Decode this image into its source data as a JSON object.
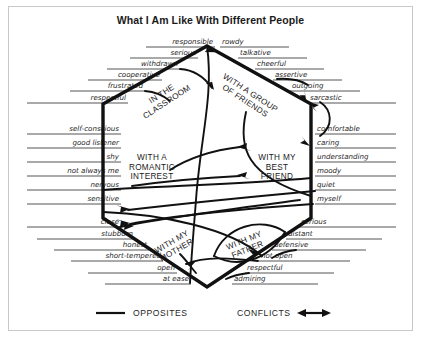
{
  "title": "What I Am Like With Different People",
  "diagram_type": "hexagonal venn-style social-context map",
  "regions": [
    {
      "id": "classroom",
      "label_lines": [
        "IN THE",
        "CLASSROOM"
      ],
      "x": 163,
      "y": 96,
      "rotate": -33
    },
    {
      "id": "friends",
      "label_lines": [
        "WITH A GROUP",
        "OF FRIENDS"
      ],
      "x": 249,
      "y": 95,
      "rotate": 33
    },
    {
      "id": "romantic",
      "label_lines": [
        "WITH A",
        "ROMANTIC",
        "INTEREST"
      ],
      "x": 152,
      "y": 160,
      "rotate": 0
    },
    {
      "id": "bestfriend",
      "label_lines": [
        "WITH MY",
        "BEST",
        "FRIEND"
      ],
      "x": 277,
      "y": 160,
      "rotate": 0
    },
    {
      "id": "mother",
      "label_lines": [
        "WITH MY",
        "MOTHER"
      ],
      "x": 173,
      "y": 244,
      "rotate": -30
    },
    {
      "id": "father",
      "label_lines": [
        "WITH MY",
        "FATHER"
      ],
      "x": 245,
      "y": 243,
      "rotate": -22
    }
  ],
  "traits_left": [
    {
      "text": "responsible",
      "y": 44,
      "x": 213,
      "rule_x1": 146,
      "rule_y": 47
    },
    {
      "text": "serious",
      "y": 55,
      "x": 196,
      "rule_x1": 130,
      "rule_y": 58
    },
    {
      "text": "withdrawn",
      "y": 66,
      "x": 178,
      "rule_x1": 107,
      "rule_y": 69
    },
    {
      "text": "cooperative",
      "y": 77,
      "x": 160,
      "rule_x1": 88,
      "rule_y": 80
    },
    {
      "text": "frustrated",
      "y": 88,
      "x": 143,
      "rule_x1": 70,
      "rule_y": 91
    },
    {
      "text": "respectful",
      "y": 100,
      "x": 126,
      "rule_x1": 27,
      "rule_y": 103
    },
    {
      "text": "self-conscious",
      "y": 131,
      "x": 119,
      "rule_x1": 27,
      "rule_y": 134
    },
    {
      "text": "good listener",
      "y": 145,
      "x": 119,
      "rule_x1": 27,
      "rule_y": 148
    },
    {
      "text": "shy",
      "y": 159,
      "x": 119,
      "rule_x1": 27,
      "rule_y": 162
    },
    {
      "text": "not always me",
      "y": 173,
      "x": 119,
      "rule_x1": 27,
      "rule_y": 176
    },
    {
      "text": "nervous",
      "y": 187,
      "x": 119,
      "rule_x1": 27,
      "rule_y": 190
    },
    {
      "text": "sensitive",
      "y": 201,
      "x": 119,
      "rule_x1": 27,
      "rule_y": 204
    },
    {
      "text": "close",
      "y": 224,
      "x": 119,
      "rule_x1": 27,
      "rule_y": 227
    },
    {
      "text": "stubborn",
      "y": 236,
      "x": 133,
      "rule_x1": 37,
      "rule_y": 239
    },
    {
      "text": "honest",
      "y": 247,
      "x": 147,
      "rule_x1": 54,
      "rule_y": 250
    },
    {
      "text": "short-tempered",
      "y": 258,
      "x": 161,
      "rule_x1": 71,
      "rule_y": 261
    },
    {
      "text": "open",
      "y": 270,
      "x": 175,
      "rule_x1": 88,
      "rule_y": 273
    },
    {
      "text": "at ease",
      "y": 281,
      "x": 189,
      "rule_x1": 105,
      "rule_y": 284
    }
  ],
  "traits_right": [
    {
      "text": "rowdy",
      "y": 44,
      "x": 222,
      "rule_x2": 289,
      "rule_y": 47
    },
    {
      "text": "talkative",
      "y": 55,
      "x": 240,
      "rule_x2": 307,
      "rule_y": 58
    },
    {
      "text": "cheerful",
      "y": 66,
      "x": 257,
      "rule_x2": 324,
      "rule_y": 69
    },
    {
      "text": "assertive",
      "y": 77,
      "x": 275,
      "rule_x2": 342,
      "rule_y": 80
    },
    {
      "text": "outgoing",
      "y": 88,
      "x": 292,
      "rule_x2": 360,
      "rule_y": 91
    },
    {
      "text": "sarcastic",
      "y": 100,
      "x": 310,
      "rule_x2": 396,
      "rule_y": 103
    },
    {
      "text": "comfortable",
      "y": 131,
      "x": 317,
      "rule_x2": 396,
      "rule_y": 134
    },
    {
      "text": "caring",
      "y": 145,
      "x": 317,
      "rule_x2": 396,
      "rule_y": 148
    },
    {
      "text": "understanding",
      "y": 159,
      "x": 317,
      "rule_x2": 396,
      "rule_y": 162
    },
    {
      "text": "moody",
      "y": 173,
      "x": 317,
      "rule_x2": 396,
      "rule_y": 176
    },
    {
      "text": "quiet",
      "y": 187,
      "x": 317,
      "rule_x2": 396,
      "rule_y": 190
    },
    {
      "text": "myself",
      "y": 201,
      "x": 317,
      "rule_x2": 396,
      "rule_y": 204
    },
    {
      "text": "serious",
      "y": 224,
      "x": 301,
      "rule_x2": 396,
      "rule_y": 227
    },
    {
      "text": "distant",
      "y": 236,
      "x": 288,
      "rule_x2": 382,
      "rule_y": 239
    },
    {
      "text": "defensive",
      "y": 247,
      "x": 274,
      "rule_x2": 366,
      "rule_y": 250
    },
    {
      "text": "not open",
      "y": 258,
      "x": 261,
      "rule_x2": 350,
      "rule_y": 261
    },
    {
      "text": "respectful",
      "y": 270,
      "x": 247,
      "rule_x2": 334,
      "rule_y": 273
    },
    {
      "text": "admiring",
      "y": 281,
      "x": 234,
      "rule_x2": 318,
      "rule_y": 284
    }
  ],
  "legend": {
    "opposites_label": "OPPOSITES",
    "conflicts_label": "CONFLICTS"
  },
  "colors": {
    "ink": "#111111",
    "text": "#1d1d1d",
    "frame": "#c9c9c9",
    "background": "#ffffff"
  }
}
